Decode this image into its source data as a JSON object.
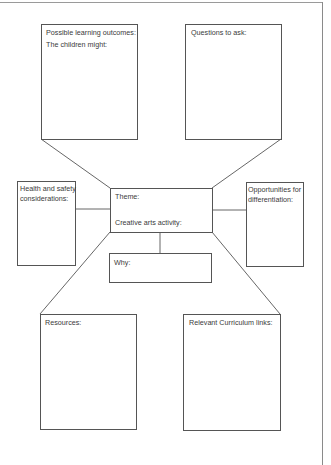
{
  "worksheet": {
    "boxes": {
      "learning_outcomes": {
        "line1": "Possible learning outcomes:",
        "line2": "The children might:"
      },
      "questions": {
        "label": "Questions to ask:"
      },
      "health_safety": {
        "line1": "Health and safety",
        "line2": "considerations:"
      },
      "theme": {
        "theme_label": "Theme:",
        "activity_label": "Creative arts activity:"
      },
      "why": {
        "label": "Why:"
      },
      "differentiation": {
        "line1": "Opportunities for",
        "line2": "differentiation:"
      },
      "resources": {
        "label": "Resources:"
      },
      "curriculum": {
        "label": "Relevant Curriculum links:"
      }
    },
    "colors": {
      "line": "#555555",
      "text": "#3a3a3a",
      "background": "#ffffff"
    }
  }
}
